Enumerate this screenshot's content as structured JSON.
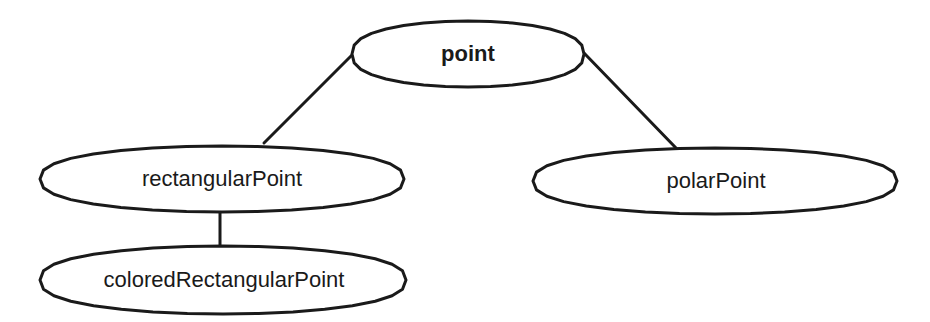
{
  "diagram": {
    "type": "class-hierarchy",
    "stroke_color": "#1a1a1a",
    "background": "#ffffff",
    "nodes": [
      {
        "id": "point",
        "label": "point",
        "bold": true,
        "cx": 468,
        "cy": 54,
        "rx": 116,
        "ry": 33
      },
      {
        "id": "rectangularPoint",
        "label": "rectangularPoint",
        "bold": false,
        "cx": 222,
        "cy": 179,
        "rx": 182,
        "ry": 33
      },
      {
        "id": "polarPoint",
        "label": "polarPoint",
        "bold": false,
        "cx": 715,
        "cy": 181,
        "rx": 182,
        "ry": 33
      },
      {
        "id": "coloredRectangularPoint",
        "label": "coloredRectangularPoint",
        "bold": false,
        "cx": 223,
        "cy": 280,
        "rx": 183,
        "ry": 34
      }
    ],
    "edges": [
      {
        "from": "point",
        "to": "rectangularPoint",
        "x1": 352,
        "y1": 55,
        "x2": 264,
        "y2": 143
      },
      {
        "from": "point",
        "to": "polarPoint",
        "x1": 584,
        "y1": 53,
        "x2": 676,
        "y2": 148
      },
      {
        "from": "rectangularPoint",
        "to": "coloredRectangularPoint",
        "x1": 220,
        "y1": 210,
        "x2": 220,
        "y2": 247
      }
    ]
  },
  "labels": {
    "point": "point",
    "rectangularPoint": "rectangularPoint",
    "polarPoint": "polarPoint",
    "coloredRectangularPoint": "coloredRectangularPoint"
  }
}
